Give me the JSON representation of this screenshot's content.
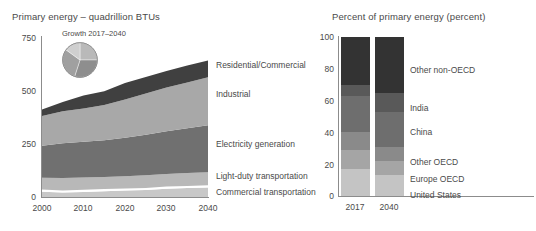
{
  "left": {
    "title": "Primary energy – quadrillion BTUs",
    "inset_caption": "Growth 2017–2040",
    "y_ticks": [
      "750",
      "500",
      "250",
      "0"
    ],
    "x_ticks": [
      "2000",
      "2010",
      "2020",
      "2030",
      "2040"
    ],
    "series_labels": [
      "Residential/Commercial",
      "Industrial",
      "Electricity generation",
      "Light-duty transportation",
      "Commercial transportation"
    ]
  },
  "right": {
    "title": "Percent of primary energy (percent)",
    "y_ticks": [
      "100",
      "80",
      "60",
      "40",
      "20",
      "0"
    ],
    "x_ticks": [
      "2017",
      "2040"
    ],
    "series_labels": [
      "Other non-OECD",
      "India",
      "China",
      "Other OECD",
      "Europe OECD",
      "United States"
    ]
  },
  "colors": {
    "residential_commercial": "#404040",
    "industrial": "#a8a8a8",
    "electricity_generation": "#707070",
    "light_duty_transportation": "#b8b8b8",
    "commercial_transportation": "#c8c8c8",
    "separator": "#ffffff",
    "other_non_oecd": "#333333",
    "india": "#595959",
    "china": "#6e6e6e",
    "other_oecd": "#8a8a8a",
    "europe_oecd": "#a5a5a5",
    "united_states": "#c4c4c4",
    "axis": "#8c8c8c",
    "text": "#4a4a4a"
  },
  "chart_data": [
    {
      "type": "area",
      "title": "Primary energy – quadrillion BTUs",
      "xlabel": "",
      "ylabel": "quadrillion BTUs",
      "ylim": [
        0,
        750
      ],
      "xlim": [
        2000,
        2040
      ],
      "grid": false,
      "legend": "right-inline",
      "x": [
        2000,
        2005,
        2010,
        2015,
        2020,
        2025,
        2030,
        2035,
        2040
      ],
      "stacked": true,
      "series": [
        {
          "name": "Commercial transportation",
          "values": [
            25,
            27,
            28,
            30,
            33,
            36,
            39,
            42,
            45
          ]
        },
        {
          "name": "Light-duty transportation",
          "values": [
            55,
            58,
            57,
            57,
            58,
            59,
            60,
            61,
            62
          ]
        },
        {
          "name": "Electricity generation",
          "values": [
            150,
            162,
            168,
            172,
            180,
            190,
            200,
            210,
            220
          ]
        },
        {
          "name": "Industrial",
          "values": [
            140,
            150,
            155,
            165,
            180,
            193,
            205,
            215,
            225
          ]
        },
        {
          "name": "Residential/Commercial",
          "values": [
            30,
            43,
            62,
            66,
            68,
            70,
            72,
            74,
            78
          ]
        }
      ],
      "series_totals": [
        400,
        440,
        470,
        490,
        519,
        548,
        576,
        602,
        630
      ]
    },
    {
      "type": "pie",
      "title": "Growth 2017–2040",
      "labels": [
        "Residential/Commercial",
        "Industrial",
        "Electricity generation",
        "Transportation"
      ],
      "values": [
        25,
        30,
        30,
        15
      ],
      "colors": [
        "#b9b9b9",
        "#8e8e8e",
        "#a0a0a0",
        "#cfcfcf"
      ]
    },
    {
      "type": "bar",
      "subtype": "stacked-100-percent",
      "title": "Percent of primary energy (percent)",
      "xlabel": "",
      "ylabel": "percent",
      "ylim": [
        0,
        100
      ],
      "grid": false,
      "categories": [
        "2017",
        "2040"
      ],
      "series": [
        {
          "name": "United States",
          "values": [
            17,
            13
          ]
        },
        {
          "name": "Europe OECD",
          "values": [
            12,
            9
          ]
        },
        {
          "name": "Other OECD",
          "values": [
            11,
            9
          ]
        },
        {
          "name": "China",
          "values": [
            23,
            22
          ]
        },
        {
          "name": "India",
          "values": [
            7,
            12
          ]
        },
        {
          "name": "Other non-OECD",
          "values": [
            30,
            35
          ]
        }
      ]
    }
  ]
}
